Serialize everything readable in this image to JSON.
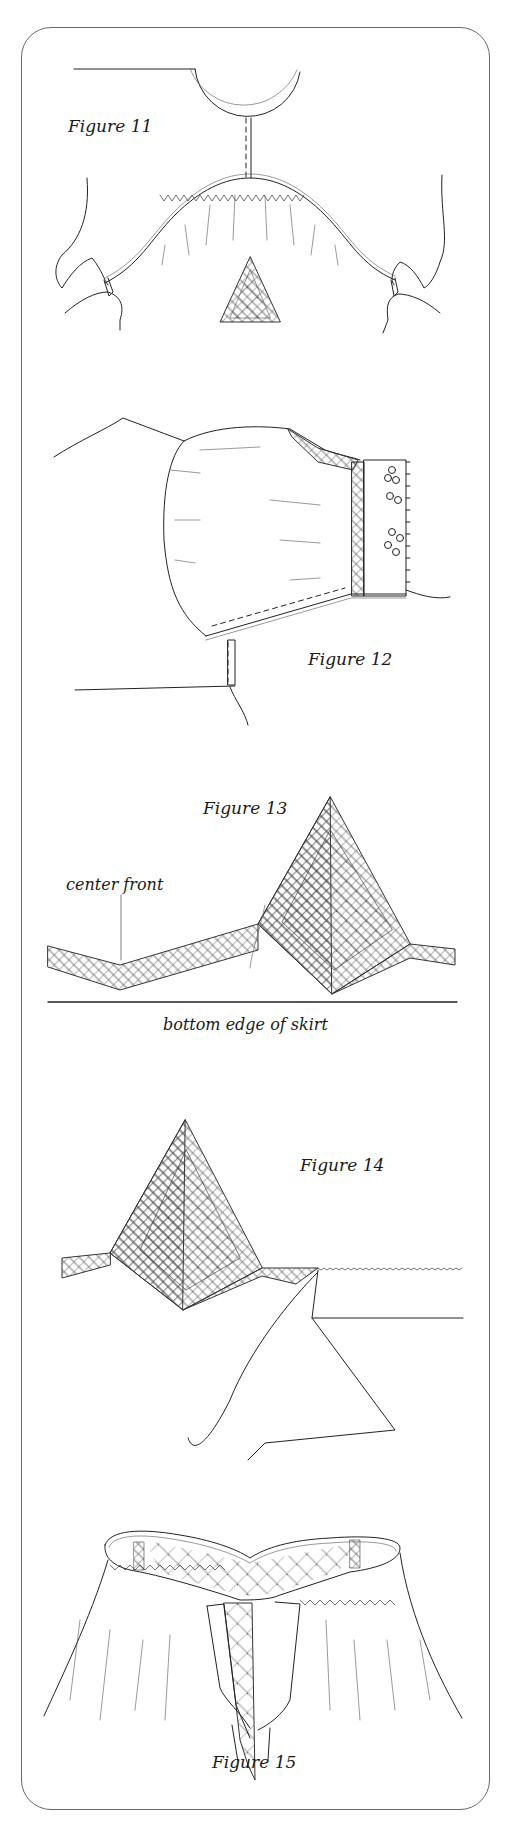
{
  "page": {
    "frame": {
      "border_color": "#6a6a6a",
      "corner_radius": 30
    },
    "figures": [
      {
        "id": "figure-11",
        "label": "Figure 11",
        "subject": "gathered neckline with lace triangle"
      },
      {
        "id": "figure-12",
        "label": "Figure 12",
        "subject": "puffed sleeve with lace band cuff"
      },
      {
        "id": "figure-13",
        "label": "Figure 13",
        "subject": "lace insertion point on skirt",
        "annotations": [
          "center front",
          "bottom edge of skirt"
        ]
      },
      {
        "id": "figure-14",
        "label": "Figure 14",
        "subject": "lace point with cut fabric beneath"
      },
      {
        "id": "figure-15",
        "label": "Figure 15",
        "subject": "gathered skirt with lace-filled waistband"
      }
    ]
  }
}
